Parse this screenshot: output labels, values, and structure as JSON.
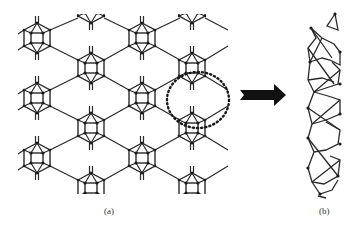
{
  "figure": {
    "panels": [
      {
        "id": "a",
        "label": "(a)",
        "description": "2D lattice of cage-like units connected in a hexagonal network"
      },
      {
        "id": "b",
        "label": "(b)",
        "description": "1D nanotube-like chain extracted from highlighted unit"
      }
    ],
    "highlight": {
      "shape": "dotted-ellipse"
    },
    "arrow": {
      "direction": "right"
    },
    "colors": {
      "bond": "#2a2a2a",
      "atom": "#1a1a1a",
      "background": "#ffffff"
    }
  }
}
